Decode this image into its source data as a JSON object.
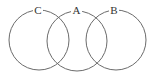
{
  "diagram": {
    "type": "venn",
    "sets": [
      {
        "label": "C",
        "cx": 39,
        "cy": 40,
        "r": 30
      },
      {
        "label": "A",
        "cx": 77,
        "cy": 41,
        "r": 30
      },
      {
        "label": "B",
        "cx": 116,
        "cy": 40,
        "r": 30
      }
    ],
    "stroke_color": "#6b6b6b"
  }
}
